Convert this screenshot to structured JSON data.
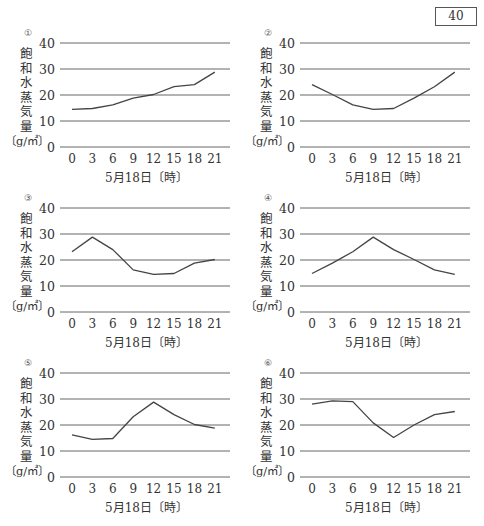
{
  "answer_box": {
    "number": "40"
  },
  "common": {
    "ylabel_chars": [
      "飽",
      "和",
      "水",
      "蒸",
      "気",
      "量"
    ],
    "yunit": "〔g/㎥〕",
    "xlabel": "5月18日〔時〕",
    "yticks": [
      "0",
      "10",
      "20",
      "30",
      "40"
    ],
    "xticks": [
      "0",
      "3",
      "6",
      "9",
      "12",
      "15",
      "18",
      "21"
    ]
  },
  "panels": [
    {
      "label": "①"
    },
    {
      "label": "②"
    },
    {
      "label": "③"
    },
    {
      "label": "④"
    },
    {
      "label": "⑤"
    },
    {
      "label": "⑥"
    }
  ],
  "colors": {
    "line": "#444444",
    "grid": "#666666",
    "text": "#333333"
  },
  "chart_data": [
    {
      "type": "line",
      "title": "①",
      "xlabel": "5月18日〔時〕",
      "ylabel": "飽和水蒸気量〔g/㎥〕",
      "x": [
        0,
        3,
        6,
        9,
        12,
        15,
        18,
        21
      ],
      "values": [
        14.5,
        14.8,
        16.2,
        18.8,
        20.2,
        23.2,
        24.0,
        28.8
      ],
      "ylim": [
        0,
        40
      ],
      "yticks": [
        0,
        10,
        20,
        30,
        40
      ],
      "grid": "horizontal",
      "legend": "none"
    },
    {
      "type": "line",
      "title": "②",
      "xlabel": "5月18日〔時〕",
      "ylabel": "飽和水蒸気量〔g/㎥〕",
      "x": [
        0,
        3,
        6,
        9,
        12,
        15,
        18,
        21
      ],
      "values": [
        24.0,
        20.2,
        16.2,
        14.5,
        14.8,
        18.8,
        23.2,
        28.8
      ],
      "ylim": [
        0,
        40
      ],
      "yticks": [
        0,
        10,
        20,
        30,
        40
      ],
      "grid": "horizontal",
      "legend": "none"
    },
    {
      "type": "line",
      "title": "③",
      "xlabel": "5月18日〔時〕",
      "ylabel": "飽和水蒸気量〔g/㎥〕",
      "x": [
        0,
        3,
        6,
        9,
        12,
        15,
        18,
        21
      ],
      "values": [
        23.2,
        28.8,
        24.0,
        16.2,
        14.5,
        14.8,
        18.8,
        20.2
      ],
      "ylim": [
        0,
        40
      ],
      "yticks": [
        0,
        10,
        20,
        30,
        40
      ],
      "grid": "horizontal",
      "legend": "none"
    },
    {
      "type": "line",
      "title": "④",
      "xlabel": "5月18日〔時〕",
      "ylabel": "飽和水蒸気量〔g/㎥〕",
      "x": [
        0,
        3,
        6,
        9,
        12,
        15,
        18,
        21
      ],
      "values": [
        14.8,
        18.8,
        23.2,
        28.8,
        24.0,
        20.2,
        16.2,
        14.5
      ],
      "ylim": [
        0,
        40
      ],
      "yticks": [
        0,
        10,
        20,
        30,
        40
      ],
      "grid": "horizontal",
      "legend": "none"
    },
    {
      "type": "line",
      "title": "⑤",
      "xlabel": "5月18日〔時〕",
      "ylabel": "飽和水蒸気量〔g/㎥〕",
      "x": [
        0,
        3,
        6,
        9,
        12,
        15,
        18,
        21
      ],
      "values": [
        16.2,
        14.5,
        14.8,
        23.2,
        28.8,
        24.0,
        20.2,
        18.8
      ],
      "ylim": [
        0,
        40
      ],
      "yticks": [
        0,
        10,
        20,
        30,
        40
      ],
      "grid": "horizontal",
      "legend": "none"
    },
    {
      "type": "line",
      "title": "⑥",
      "xlabel": "5月18日〔時〕",
      "ylabel": "飽和水蒸気量〔g/㎥〕",
      "x": [
        0,
        3,
        6,
        9,
        12,
        15,
        18,
        21
      ],
      "values": [
        28.0,
        29.3,
        29.0,
        20.8,
        15.2,
        20.0,
        24.0,
        25.2
      ],
      "ylim": [
        0,
        40
      ],
      "yticks": [
        0,
        10,
        20,
        30,
        40
      ],
      "grid": "horizontal",
      "legend": "none"
    }
  ]
}
